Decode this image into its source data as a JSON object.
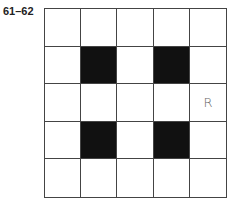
{
  "label": "61–62",
  "grid": {
    "rows": 5,
    "cols": 5,
    "cells": [
      [
        {
          "fill": false,
          "text": ""
        },
        {
          "fill": false,
          "text": ""
        },
        {
          "fill": false,
          "text": ""
        },
        {
          "fill": false,
          "text": ""
        },
        {
          "fill": false,
          "text": ""
        }
      ],
      [
        {
          "fill": false,
          "text": ""
        },
        {
          "fill": true,
          "text": ""
        },
        {
          "fill": false,
          "text": ""
        },
        {
          "fill": true,
          "text": ""
        },
        {
          "fill": false,
          "text": ""
        }
      ],
      [
        {
          "fill": false,
          "text": ""
        },
        {
          "fill": false,
          "text": ""
        },
        {
          "fill": false,
          "text": ""
        },
        {
          "fill": false,
          "text": ""
        },
        {
          "fill": false,
          "text": "R"
        }
      ],
      [
        {
          "fill": false,
          "text": ""
        },
        {
          "fill": true,
          "text": ""
        },
        {
          "fill": false,
          "text": ""
        },
        {
          "fill": true,
          "text": ""
        },
        {
          "fill": false,
          "text": ""
        }
      ],
      [
        {
          "fill": false,
          "text": ""
        },
        {
          "fill": false,
          "text": ""
        },
        {
          "fill": false,
          "text": ""
        },
        {
          "fill": false,
          "text": ""
        },
        {
          "fill": false,
          "text": ""
        }
      ]
    ],
    "colors": {
      "filled": "#111111",
      "empty": "#ffffff",
      "line": "#444444",
      "mark": "#666666"
    }
  }
}
